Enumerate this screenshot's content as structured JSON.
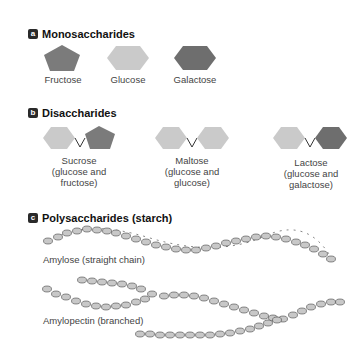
{
  "colors": {
    "fructose": "#7b7b7b",
    "glucose": "#cacaca",
    "galactose": "#6e6e6e",
    "bond": "#333333",
    "badge": "#2a2a2a"
  },
  "sections": {
    "a": {
      "badge": "a",
      "title": "Monosaccharides",
      "items": [
        {
          "name": "Fructose",
          "shape": "pentagon"
        },
        {
          "name": "Glucose",
          "shape": "hexagon"
        },
        {
          "name": "Galactose",
          "shape": "hexagon"
        }
      ]
    },
    "b": {
      "badge": "b",
      "title": "Disaccharides",
      "items": [
        {
          "name": "Sucrose",
          "line2": "(glucose and",
          "line3": "fructose)"
        },
        {
          "name": "Maltose",
          "line2": "(glucose and",
          "line3": "glucose)"
        },
        {
          "name": "Lactose",
          "line2": "(glucose and",
          "line3": "galactose)"
        }
      ]
    },
    "c": {
      "badge": "c",
      "title": "Polysaccharides (starch)",
      "items": [
        {
          "name": "Amylose (straight chain)"
        },
        {
          "name": "Amylopectin (branched)"
        }
      ]
    }
  }
}
